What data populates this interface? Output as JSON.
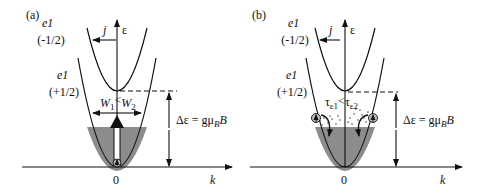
{
  "figure": {
    "panels": [
      {
        "id": "a",
        "label": "(a)",
        "upper_band": {
          "name": "e1",
          "spin": "(-1/2)"
        },
        "lower_band": {
          "name": "e1",
          "spin": "(+1/2)"
        },
        "current_label": "j",
        "energy_axis": "ε",
        "k_axis": "k",
        "origin": "0",
        "comparison": {
          "left": "W",
          "left_sub": "1",
          "op": "<",
          "right": "W",
          "right_sub": "2"
        },
        "splitting": {
          "prefix": "Δε = gμ",
          "sub": "B",
          "suffix": "B"
        }
      },
      {
        "id": "b",
        "label": "(b)",
        "upper_band": {
          "name": "e1",
          "spin": "(-1/2)"
        },
        "lower_band": {
          "name": "e1",
          "spin": "(+1/2)"
        },
        "current_label": "j",
        "energy_axis": "ε",
        "k_axis": "k",
        "origin": "0",
        "comparison": {
          "left": "τ",
          "left_sub": "ε1",
          "op": "<",
          "right": "τ",
          "right_sub": "ε2"
        },
        "splitting": {
          "prefix": "Δε = gμ",
          "sub": "B",
          "suffix": "B"
        }
      }
    ],
    "colors": {
      "line": "#111111",
      "fill": "#8c8c8c",
      "background": "#ffffff"
    }
  }
}
